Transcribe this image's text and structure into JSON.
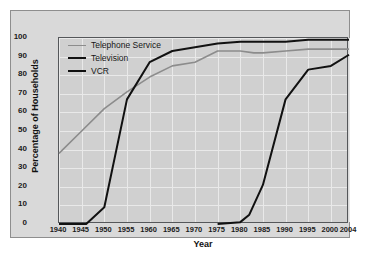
{
  "chart": {
    "type": "line",
    "title": "",
    "xlabel": "Year",
    "ylabel": "Percentage of Households",
    "xticks": [
      "1940",
      "1945",
      "1950",
      "1955",
      "1960",
      "1965",
      "1970",
      "1975",
      "1980",
      "1985",
      "1990",
      "1995",
      "2000",
      "2004"
    ],
    "yticks": [
      "0",
      "10",
      "20",
      "30",
      "40",
      "50",
      "60",
      "70",
      "80",
      "90",
      "100"
    ],
    "xlim": [
      1940,
      2004
    ],
    "ylim": [
      0,
      100
    ],
    "grid": true,
    "legend_position": "top-left",
    "colors": {
      "telephone": "#8c8c8c",
      "television": "#111111",
      "vcr": "#111111",
      "plot_background": "#d0d0d0",
      "card_background": "#d9d9d9",
      "gridline": "#e9e9e9",
      "axis": "#55575a"
    },
    "series": [
      {
        "name": "Telephone Service",
        "color_key": "telephone",
        "x": [
          1940,
          1945,
          1950,
          1955,
          1960,
          1965,
          1970,
          1975,
          1980,
          1983,
          1985,
          1990,
          1995,
          2000,
          2004
        ],
        "values": [
          38,
          50,
          62,
          71,
          79,
          85,
          87,
          93,
          93,
          92,
          92,
          93,
          94,
          94,
          94
        ]
      },
      {
        "name": "Television",
        "color_key": "television",
        "x": [
          1940,
          1946,
          1950,
          1955,
          1960,
          1965,
          1970,
          1975,
          1980,
          1985,
          1990,
          1995,
          2000,
          2004
        ],
        "values": [
          0,
          0,
          9,
          67,
          87,
          93,
          95,
          97,
          98,
          98,
          98,
          99,
          99,
          99
        ]
      },
      {
        "name": "VCR",
        "color_key": "vcr",
        "x": [
          1975,
          1980,
          1982,
          1985,
          1990,
          1995,
          2000,
          2004
        ],
        "values": [
          0,
          1,
          5,
          21,
          67,
          83,
          85,
          91
        ]
      }
    ]
  },
  "legend": {
    "items": [
      {
        "label": "Telephone Service"
      },
      {
        "label": "Television"
      },
      {
        "label": "VCR"
      }
    ]
  }
}
